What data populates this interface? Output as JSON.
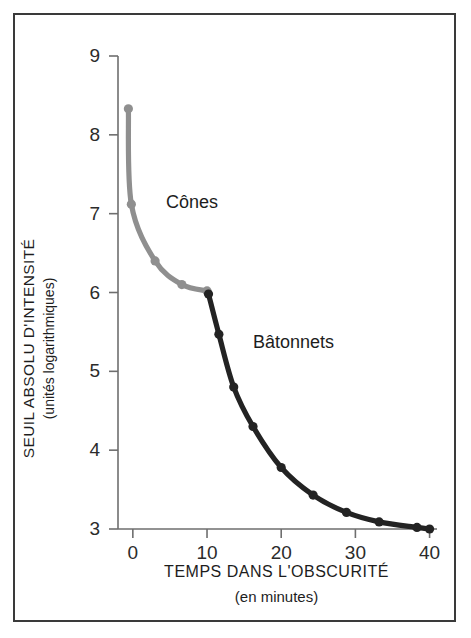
{
  "figure": {
    "border_color": "#3a3a3a",
    "background": "#ffffff"
  },
  "axes": {
    "y": {
      "title_line1": "SEUIL ABSOLU D'INTENSITÉ",
      "title_line2": "(unités logarithmiques)",
      "ticks": [
        9,
        8,
        7,
        6,
        5,
        4,
        3
      ],
      "tick_labels": [
        "9",
        "8",
        "7",
        "6",
        "5",
        "4",
        "3"
      ],
      "range": [
        3,
        9
      ],
      "axis_color": "#6e6e6e"
    },
    "x": {
      "title_line1": "TEMPS DANS L'OBSCURITÉ",
      "title_line2": "(en minutes)",
      "ticks": [
        0,
        10,
        20,
        30,
        40
      ],
      "tick_labels": [
        "0",
        "10",
        "20",
        "30",
        "40"
      ],
      "range": [
        -2,
        41
      ],
      "axis_color": "#6e6e6e"
    }
  },
  "annotations": {
    "cones_label": "Cônes",
    "batonnets_label": "Bâtonnets"
  },
  "chart_data": {
    "type": "line",
    "title": "",
    "subtitle": "",
    "xlabel": "TEMPS DANS L'OBSCURITÉ (en minutes)",
    "ylabel": "SEUIL ABSOLU D'INTENSITÉ (unités logarithmiques)",
    "xlim": [
      -2,
      41
    ],
    "ylim": [
      3,
      9
    ],
    "grid": false,
    "legend": "inline-annotations",
    "series": [
      {
        "name": "Cônes",
        "color": "#8f8f8f",
        "marker": "circle",
        "points": [
          {
            "x": -0.6,
            "y": 8.33
          },
          {
            "x": -0.2,
            "y": 7.12
          },
          {
            "x": 3.0,
            "y": 6.4
          },
          {
            "x": 6.6,
            "y": 6.1
          },
          {
            "x": 10.0,
            "y": 6.02
          }
        ]
      },
      {
        "name": "Bâtonnets",
        "color": "#232323",
        "marker": "circle",
        "points": [
          {
            "x": 10.2,
            "y": 5.98
          },
          {
            "x": 11.6,
            "y": 5.47
          },
          {
            "x": 13.6,
            "y": 4.8
          },
          {
            "x": 16.2,
            "y": 4.3
          },
          {
            "x": 20.0,
            "y": 3.78
          },
          {
            "x": 24.3,
            "y": 3.43
          },
          {
            "x": 28.8,
            "y": 3.21
          },
          {
            "x": 33.2,
            "y": 3.09
          },
          {
            "x": 38.3,
            "y": 3.02
          },
          {
            "x": 40.0,
            "y": 3.0
          }
        ]
      }
    ]
  }
}
